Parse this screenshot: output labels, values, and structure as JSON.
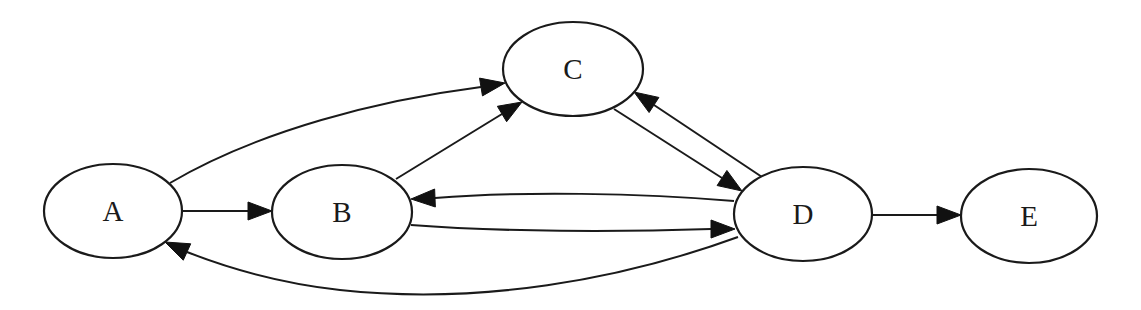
{
  "diagram": {
    "type": "directed-graph",
    "nodes": [
      {
        "id": "A",
        "label": "A",
        "cx": 113,
        "cy": 211,
        "rx": 69,
        "ry": 47
      },
      {
        "id": "B",
        "label": "B",
        "cx": 342,
        "cy": 212,
        "rx": 70,
        "ry": 47
      },
      {
        "id": "C",
        "label": "C",
        "cx": 573,
        "cy": 69,
        "rx": 70,
        "ry": 47
      },
      {
        "id": "D",
        "label": "D",
        "cx": 803,
        "cy": 214,
        "rx": 69,
        "ry": 47
      },
      {
        "id": "E",
        "label": "E",
        "cx": 1029,
        "cy": 216,
        "rx": 68,
        "ry": 47
      }
    ],
    "edges": [
      {
        "from": "A",
        "to": "B",
        "path": "M182,211 L248,211",
        "arrow": "248,211 272,211"
      },
      {
        "from": "A",
        "to": "C",
        "path": "M170,183 C260,130 380,100 481,87",
        "arrow": "481,87 505,83"
      },
      {
        "from": "B",
        "to": "C",
        "path": "M396,179 L502,114",
        "arrow": "502,114 522,102"
      },
      {
        "from": "C",
        "to": "D",
        "path": "M614,109 L722,178",
        "arrow": "722,178 742,191"
      },
      {
        "from": "D",
        "to": "C",
        "path": "M762,177 L654,105",
        "arrow": "654,105 634,92"
      },
      {
        "from": "D",
        "to": "B",
        "path": "M734,201 C640,193 520,191 435,198",
        "arrow": "435,198 411,199"
      },
      {
        "from": "B",
        "to": "D",
        "path": "M411,225 C500,232 620,232 711,229",
        "arrow": "711,229 735,229"
      },
      {
        "from": "D",
        "to": "A",
        "path": "M738,237 C620,280 480,305 340,290 C270,282 220,265 187,252",
        "arrow": "187,252 165,242"
      },
      {
        "from": "D",
        "to": "E",
        "path": "M872,215 L937,215",
        "arrow": "937,215 961,215"
      }
    ]
  }
}
